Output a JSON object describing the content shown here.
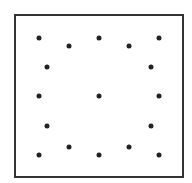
{
  "diagram": {
    "frame": {
      "x": 14,
      "y": 14,
      "width": 170,
      "height": 164,
      "border_color": "#333333"
    },
    "dot_color": "#222222",
    "dot_count": 18,
    "dots": [
      {
        "x": 39,
        "y": 38
      },
      {
        "x": 69,
        "y": 46
      },
      {
        "x": 99,
        "y": 38
      },
      {
        "x": 129,
        "y": 46
      },
      {
        "x": 159,
        "y": 38
      },
      {
        "x": 47,
        "y": 67
      },
      {
        "x": 151,
        "y": 67
      },
      {
        "x": 39,
        "y": 96
      },
      {
        "x": 99,
        "y": 96
      },
      {
        "x": 159,
        "y": 96
      },
      {
        "x": 47,
        "y": 126
      },
      {
        "x": 151,
        "y": 126
      },
      {
        "x": 39,
        "y": 155
      },
      {
        "x": 69,
        "y": 147
      },
      {
        "x": 99,
        "y": 155
      },
      {
        "x": 129,
        "y": 147
      },
      {
        "x": 159,
        "y": 155
      }
    ]
  }
}
